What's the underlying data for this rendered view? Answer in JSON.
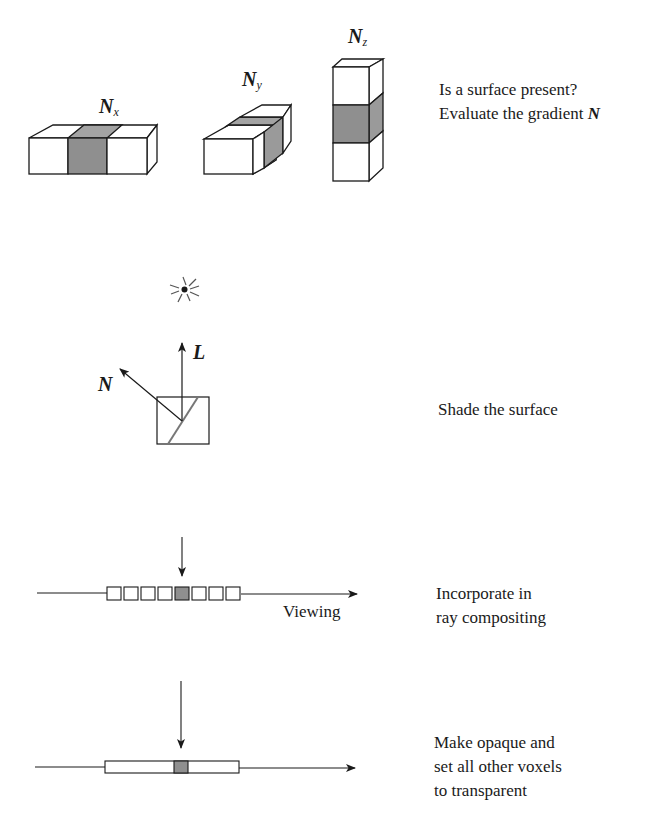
{
  "steps": [
    {
      "id": "gradient",
      "text_lines": [
        "Is a surface present?",
        "Evaluate the gradient"
      ],
      "text_suffix_symbol": "N",
      "symbols": {
        "nx": {
          "base": "N",
          "sub": "x"
        },
        "ny": {
          "base": "N",
          "sub": "y"
        },
        "nz": {
          "base": "N",
          "sub": "z"
        }
      }
    },
    {
      "id": "shade",
      "text_lines": [
        "Shade the surface"
      ],
      "symbols": {
        "normal": "N",
        "light": "L"
      },
      "icons": [
        "light-source-icon"
      ]
    },
    {
      "id": "composite",
      "text_lines": [
        "Incorporate in",
        "ray compositing"
      ],
      "ray_label": "Viewing",
      "voxel_count": 8,
      "highlighted_voxel_index": 4
    },
    {
      "id": "opaque",
      "text_lines": [
        "Make opaque and",
        "set all other voxels",
        "to transparent"
      ]
    }
  ],
  "colors": {
    "stroke": "#1a1a1a",
    "shaded_face": "#8f8f8f",
    "shaded_top": "#a3a3a3",
    "shaded_side": "#9a9a9a",
    "background": "#ffffff"
  }
}
